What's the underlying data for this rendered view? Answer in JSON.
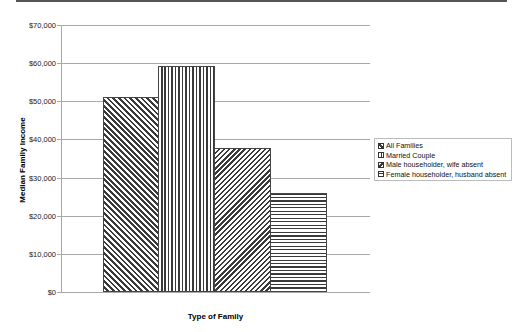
{
  "chart_data": {
    "type": "bar",
    "title": "",
    "xlabel": "Type of Family",
    "ylabel": "Median Family Income",
    "ylim": [
      0,
      70000
    ],
    "yticks": [
      "$0",
      "$10,000",
      "$20,000",
      "$30,000",
      "$40,000",
      "$50,000",
      "$60,000",
      "$70,000"
    ],
    "ytick_values": [
      0,
      10000,
      20000,
      30000,
      40000,
      50000,
      60000,
      70000
    ],
    "grid": true,
    "legend_position": "right",
    "categories": [
      ""
    ],
    "series": [
      {
        "name": "All Families",
        "values": [
          51000
        ],
        "pattern": "diag-down"
      },
      {
        "name": "Married Couple",
        "values": [
          59200
        ],
        "pattern": "vertical"
      },
      {
        "name": "Male householder, wife absent",
        "values": [
          37700
        ],
        "pattern": "diag-up"
      },
      {
        "name": "Female householder, husband absent",
        "values": [
          25900
        ],
        "pattern": "horizontal"
      }
    ]
  },
  "colors": {
    "bar_ink": "#3a3a3a",
    "gridline": "#a8a8a8",
    "background": "#ffffff"
  }
}
